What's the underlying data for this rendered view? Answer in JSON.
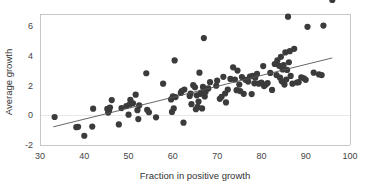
{
  "chart_data": {
    "type": "scatter",
    "title": "",
    "xlabel": "Fraction in positive growth",
    "ylabel": "Average growth",
    "xlim": [
      30,
      100
    ],
    "ylim": [
      -2,
      6.8
    ],
    "xticks": [
      30,
      40,
      50,
      60,
      70,
      80,
      90,
      100
    ],
    "yticks": [
      -2,
      0,
      2,
      4,
      6
    ],
    "xtick_labels": [
      "30",
      "40",
      "50",
      "60",
      "70",
      "80",
      "90",
      "100"
    ],
    "ytick_labels": [
      "-2",
      "0",
      "2",
      "4",
      "6"
    ],
    "grid": "zero-line-only",
    "legend": "none",
    "marker": {
      "shape": "circle",
      "color": "#3b3b3b",
      "size": 3.1
    },
    "trendline": {
      "type": "linear",
      "color": "#555555",
      "x_start": 33.0,
      "y_start": -0.78,
      "x_end": 96.0,
      "y_end": 3.85,
      "slope": 0.0735,
      "intercept": -3.205
    },
    "x": [
      33.3,
      38.2,
      38.6,
      40.0,
      41.8,
      42.0,
      45.2,
      45.4,
      45.6,
      45.8,
      46.2,
      47.8,
      48.4,
      49.5,
      50.0,
      50.2,
      50.4,
      51.0,
      51.6,
      52.0,
      52.2,
      52.4,
      54.0,
      54.2,
      54.6,
      56.2,
      57.8,
      59.6,
      59.8,
      60.0,
      60.2,
      60.4,
      60.6,
      61.8,
      62.0,
      62.4,
      62.6,
      63.8,
      64.0,
      64.2,
      64.6,
      65.0,
      65.2,
      65.4,
      65.6,
      65.8,
      66.0,
      66.2,
      66.4,
      66.6,
      66.8,
      67.0,
      67.2,
      67.4,
      68.0,
      68.4,
      69.8,
      70.0,
      70.6,
      71.0,
      71.4,
      71.8,
      72.0,
      72.4,
      73.0,
      73.6,
      74.0,
      74.4,
      74.6,
      75.0,
      75.2,
      75.6,
      76.0,
      76.4,
      77.0,
      77.4,
      77.8,
      78.0,
      78.4,
      78.6,
      79.0,
      79.4,
      80.0,
      80.4,
      80.6,
      81.0,
      81.4,
      82.0,
      82.4,
      83.0,
      83.4,
      83.6,
      84.0,
      84.2,
      84.4,
      84.6,
      84.8,
      85.0,
      85.2,
      85.4,
      85.6,
      85.8,
      86.0,
      86.2,
      86.4,
      86.6,
      87.0,
      87.4,
      88.0,
      88.4,
      89.0,
      89.6,
      90.0,
      90.4,
      91.8,
      93.0,
      93.6,
      94.0,
      96.0
    ],
    "y": [
      -0.12,
      -0.8,
      -0.78,
      -1.38,
      -0.76,
      0.44,
      0.42,
      0.18,
      0.3,
      0.52,
      1.02,
      -0.62,
      0.48,
      0.62,
      0.04,
      0.72,
      1.04,
      0.8,
      1.38,
      0.34,
      -0.26,
      0.66,
      2.82,
      0.36,
      0.2,
      -0.14,
      2.12,
      1.06,
      0.22,
      1.26,
      0.46,
      3.68,
      1.22,
      1.5,
      1.62,
      -0.5,
      1.72,
      1.3,
      1.46,
      0.74,
      2.02,
      1.88,
      0.4,
      1.34,
      0.56,
      0.92,
      2.86,
      1.44,
      1.52,
      0.46,
      1.9,
      5.18,
      1.26,
      1.58,
      1.8,
      2.22,
      1.98,
      2.32,
      1.1,
      1.24,
      2.58,
      1.46,
      0.86,
      1.72,
      2.44,
      3.22,
      2.4,
      1.68,
      3.0,
      2.06,
      1.62,
      2.56,
      1.44,
      2.38,
      2.26,
      2.6,
      1.42,
      2.64,
      2.14,
      2.52,
      2.78,
      2.12,
      2.2,
      3.3,
      1.96,
      2.06,
      2.16,
      2.84,
      1.7,
      3.44,
      2.7,
      3.68,
      3.32,
      2.52,
      3.92,
      2.28,
      3.08,
      3.36,
      2.06,
      4.22,
      2.4,
      3.04,
      6.62,
      3.56,
      4.3,
      2.64,
      2.12,
      4.46,
      2.2,
      2.22,
      2.54,
      2.48,
      2.38,
      5.94,
      2.86,
      2.74,
      2.7,
      6.02
    ]
  }
}
